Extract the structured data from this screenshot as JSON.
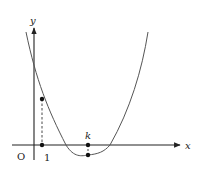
{
  "diagram": {
    "type": "function-graph",
    "axes": {
      "x_label": "x",
      "y_label": "y",
      "origin_label": "O"
    },
    "ticks": {
      "one_label": "1",
      "k_label": "k"
    },
    "points": [
      {
        "name": "point-on-curve-at-1",
        "x": "1"
      },
      {
        "name": "point-on-axis-at-1",
        "x": "1"
      },
      {
        "name": "point-on-axis-at-k",
        "x": "k"
      },
      {
        "name": "minimum-point-at-k",
        "x": "k"
      }
    ],
    "colors": {
      "axis": "#222222",
      "curve": "#555555",
      "dashed": "#333333"
    }
  }
}
